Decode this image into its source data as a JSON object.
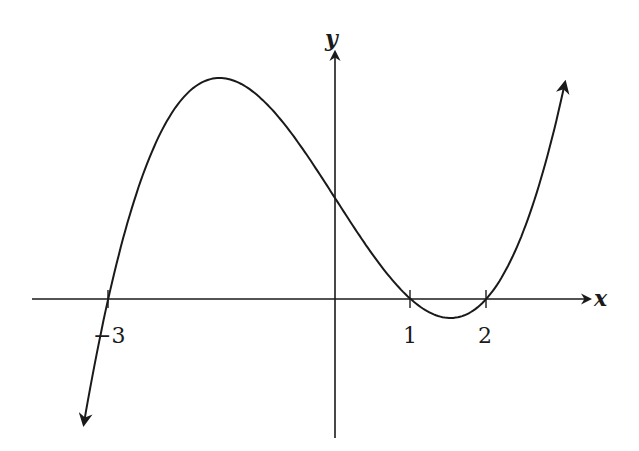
{
  "chart_data": {
    "type": "line",
    "title": "",
    "xlabel": "x",
    "ylabel": "y",
    "function": "f(x) = k(x+3)(x-1)(x-2), k > 0",
    "zeros": [
      -3,
      1,
      2
    ],
    "x_tick_labels": [
      "−3",
      "1",
      "2"
    ],
    "x_ticks": [
      -3,
      1,
      2
    ],
    "y_intercept_sign": "positive",
    "local_max_approx_x": -1.08,
    "local_min_approx_x": 1.55,
    "end_behavior": {
      "left": "down",
      "right": "up"
    },
    "grid": false,
    "arrows": true
  },
  "colors": {
    "stroke": "#1a1a1a",
    "background": "#ffffff"
  },
  "labels": {
    "x_axis": "x",
    "y_axis": "y",
    "tick_neg3": "−3",
    "tick_1": "1",
    "tick_2": "2"
  }
}
